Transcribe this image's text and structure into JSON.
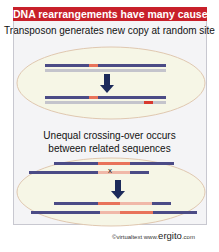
{
  "title": "DNA rearrangements have many causes",
  "section1": {
    "caption": "Transposon generates new copy at random site"
  },
  "section2": {
    "caption_line1": "Unequal crossing-over occurs",
    "caption_line2": "between related sequences",
    "cross_mark": "x"
  },
  "credit": {
    "prefix": "©virtualtext www.",
    "brand": "ergito",
    "suffix": ".com"
  },
  "colors": {
    "title_bg": "#c8202a",
    "dna_dark": "#4b4b86",
    "dna_light": "#c4c4cc",
    "orange": "#e8735a",
    "red": "#d83a30",
    "pink": "#f0b8a8",
    "arrow": "#1c2a5a",
    "ellipse_fill": "#f6f6e6",
    "ellipse_stroke": "#e0c8b0"
  }
}
